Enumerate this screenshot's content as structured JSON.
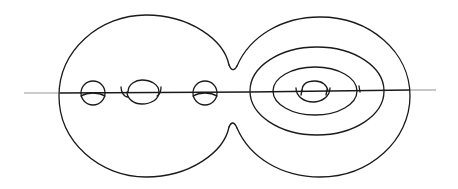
{
  "figure": {
    "colors": {
      "ink": "#1a1a1a",
      "axis": "#9a9a9a",
      "background": "#ffffff"
    },
    "left_lobe": {
      "cx": 146,
      "cy": 96,
      "r": 81,
      "handles": 3
    },
    "right_lobe": {
      "cx": 320,
      "cy": 96,
      "rx": 91,
      "ry": 81,
      "nested_ellipses": 2,
      "inner_handle": 1
    },
    "axis": {
      "y": 93,
      "x_start": 24,
      "x_end": 436
    }
  }
}
